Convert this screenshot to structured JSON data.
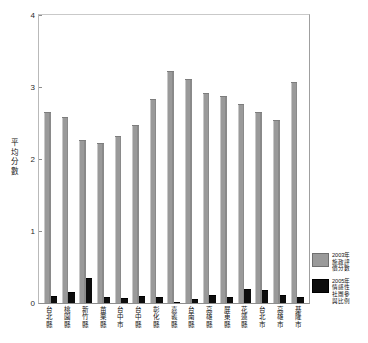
{
  "chart_data": {
    "type": "bar",
    "title": "",
    "xlabel": "",
    "ylabel": "平均分數",
    "ylabel_chars": [
      "平",
      "均",
      "分",
      "數"
    ],
    "ylim": [
      0,
      4
    ],
    "yticks": [
      4,
      3,
      2,
      1,
      0
    ],
    "grid": false,
    "legend_position": "right",
    "categories": [
      "台北縣",
      "桃園縣",
      "新竹縣",
      "苗栗縣",
      "台中市",
      "台中縣",
      "彰化縣",
      "嘉義縣",
      "台南縣",
      "高雄縣",
      "屏東縣",
      "花蓮縣",
      "台北市",
      "高雄市",
      "基隆市"
    ],
    "category_chars": [
      [
        "台",
        "北",
        "縣"
      ],
      [
        "桃",
        "園",
        "縣"
      ],
      [
        "新",
        "竹",
        "縣"
      ],
      [
        "苗",
        "栗",
        "縣"
      ],
      [
        "台",
        "中",
        "市"
      ],
      [
        "台",
        "中",
        "縣"
      ],
      [
        "彰",
        "化",
        "縣"
      ],
      [
        "嘉",
        "義",
        "縣"
      ],
      [
        "台",
        "南",
        "縣"
      ],
      [
        "高",
        "雄",
        "縣"
      ],
      [
        "屏",
        "東",
        "縣"
      ],
      [
        "花",
        "蓮",
        "縣"
      ],
      [
        "台",
        "北",
        "市"
      ],
      [
        "高",
        "雄",
        "市"
      ],
      [
        "基",
        "隆",
        "市"
      ]
    ],
    "series": [
      {
        "name": "2003年施政評價分數",
        "name_lines": [
          "2003年",
          "施政評",
          "價分數"
        ],
        "color": "#9a9a9a",
        "values": [
          2.65,
          2.58,
          2.26,
          2.22,
          2.32,
          2.47,
          2.83,
          3.22,
          3.11,
          2.91,
          2.88,
          2.77,
          2.65,
          2.54,
          3.07
        ]
      },
      {
        "name": "2005年情感性社團參與比例",
        "name_lines": [
          "2005年",
          "情感性",
          "社團參",
          "與比例"
        ],
        "color": "#0d0d0d",
        "values": [
          0.1,
          0.15,
          0.35,
          0.08,
          0.07,
          0.1,
          0.09,
          0.02,
          0.05,
          0.11,
          0.09,
          0.19,
          0.18,
          0.11,
          0.08
        ]
      }
    ]
  }
}
